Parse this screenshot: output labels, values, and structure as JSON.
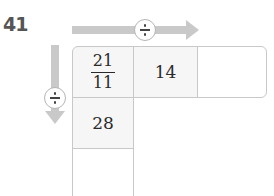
{
  "question_number": "41",
  "operators": {
    "horizontal": "÷",
    "vertical": "÷"
  },
  "arrow_color": "#c9c9c9",
  "grid": {
    "row1": {
      "cell1": {
        "numerator": "21",
        "denominator": "11"
      },
      "cell2": "14",
      "cell3": ""
    },
    "row2": {
      "cell1": "28"
    },
    "row3": {
      "cell1": ""
    }
  }
}
